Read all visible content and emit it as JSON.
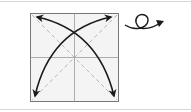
{
  "diagram": {
    "type": "origami-step",
    "square": {
      "x": 30,
      "y": 13,
      "size": 88,
      "fill": "#f4f4f4",
      "stroke": "#777777"
    },
    "creases": {
      "center_lines": true,
      "diagonals_dashed": true,
      "crease_color": "#9a9a9a"
    },
    "arrows": [
      {
        "name": "diagonal-fold-arrow-1",
        "from": "bottom-left",
        "to": "top-right",
        "double_headed": true
      },
      {
        "name": "diagonal-fold-arrow-2",
        "from": "top-left",
        "to": "bottom-right",
        "double_headed": true
      }
    ],
    "symbol": {
      "name": "turn-over-symbol",
      "meaning": "turn the paper over"
    },
    "colors": {
      "arrow": "#1a1a1a",
      "rule": "#d8d8d8"
    }
  }
}
